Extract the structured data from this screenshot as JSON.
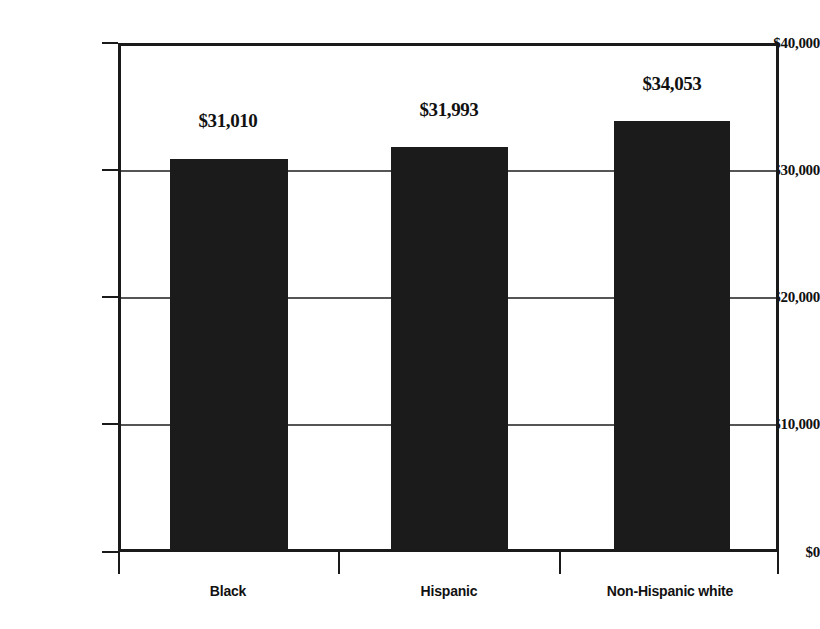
{
  "chart_data": {
    "type": "bar",
    "title": "",
    "subtitle": "",
    "xlabel": "",
    "ylabel": "",
    "categories": [
      "Black",
      "Hispanic",
      "Non-Hispanic white"
    ],
    "values": [
      31010,
      31993,
      34053
    ],
    "value_labels": [
      "$31,010",
      "$31,993",
      "$34,053"
    ],
    "ylim": [
      0,
      40000
    ],
    "ytick_values": [
      0,
      10000,
      20000,
      30000,
      40000
    ],
    "ytick_labels": [
      "$0",
      "$10,000",
      "$20,000",
      "$30,000",
      "$40,000"
    ],
    "grid": true,
    "grid_axis": "y",
    "legend": false,
    "legend_position": "none",
    "bar_color": "#1b1b1b",
    "plot_border_color": "#1a1a1a",
    "gridline_color": "#555555",
    "background_color": "#ffffff",
    "series": [
      {
        "name": "Median earnings",
        "values": [
          31010,
          31993,
          34053
        ]
      }
    ]
  },
  "accessibility": {
    "figure_description": "Bar chart comparing three values by race and ethnicity"
  }
}
